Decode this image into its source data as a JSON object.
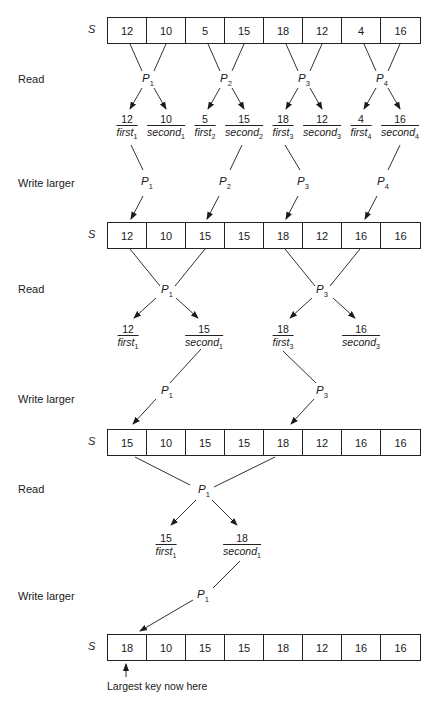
{
  "array_label": "S",
  "steps": [
    {
      "label": "Read"
    },
    {
      "label": "Write larger"
    },
    {
      "label": "Read"
    },
    {
      "label": "Write larger"
    },
    {
      "label": "Read"
    },
    {
      "label": "Write larger"
    }
  ],
  "arrays": [
    {
      "values": [
        "12",
        "10",
        "5",
        "15",
        "18",
        "12",
        "4",
        "16"
      ]
    },
    {
      "values": [
        "12",
        "10",
        "15",
        "15",
        "18",
        "12",
        "16",
        "16"
      ]
    },
    {
      "values": [
        "15",
        "10",
        "15",
        "15",
        "18",
        "12",
        "16",
        "16"
      ]
    },
    {
      "values": [
        "18",
        "10",
        "15",
        "15",
        "18",
        "12",
        "16",
        "16"
      ]
    }
  ],
  "round1": {
    "processors": [
      {
        "name": "P",
        "sub": "1"
      },
      {
        "name": "P",
        "sub": "2"
      },
      {
        "name": "P",
        "sub": "3"
      },
      {
        "name": "P",
        "sub": "4"
      }
    ],
    "reads": [
      {
        "value": "12",
        "var": "first",
        "sub": "1"
      },
      {
        "value": "10",
        "var": "second",
        "sub": "1"
      },
      {
        "value": "5",
        "var": "first",
        "sub": "2"
      },
      {
        "value": "15",
        "var": "second",
        "sub": "2"
      },
      {
        "value": "18",
        "var": "first",
        "sub": "3"
      },
      {
        "value": "12",
        "var": "second",
        "sub": "3"
      },
      {
        "value": "4",
        "var": "first",
        "sub": "4"
      },
      {
        "value": "16",
        "var": "second",
        "sub": "4"
      }
    ]
  },
  "round2": {
    "processors": [
      {
        "name": "P",
        "sub": "1"
      },
      {
        "name": "P",
        "sub": "3"
      }
    ],
    "reads": [
      {
        "value": "12",
        "var": "first",
        "sub": "1"
      },
      {
        "value": "15",
        "var": "second",
        "sub": "1"
      },
      {
        "value": "18",
        "var": "first",
        "sub": "3"
      },
      {
        "value": "16",
        "var": "second",
        "sub": "3"
      }
    ]
  },
  "round3": {
    "processors": [
      {
        "name": "P",
        "sub": "1"
      }
    ],
    "reads": [
      {
        "value": "15",
        "var": "first",
        "sub": "1"
      },
      {
        "value": "18",
        "var": "second",
        "sub": "1"
      }
    ]
  },
  "annotation": "Largest key now here"
}
